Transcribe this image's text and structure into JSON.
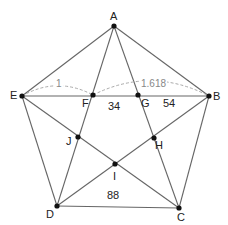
{
  "diagram": {
    "colors": {
      "line": "#666666",
      "point": "#111111",
      "dashed": "#aaaaaa",
      "text": "#222222",
      "arc_text": "#888888"
    },
    "points": {
      "A": {
        "label": "A",
        "x": 114,
        "y": 26
      },
      "B": {
        "label": "B",
        "x": 209,
        "y": 96
      },
      "C": {
        "label": "C",
        "x": 179,
        "y": 208
      },
      "D": {
        "label": "D",
        "x": 57,
        "y": 206
      },
      "E": {
        "label": "E",
        "x": 22,
        "y": 96
      },
      "F": {
        "label": "F",
        "x": 93,
        "y": 95
      },
      "G": {
        "label": "G",
        "x": 138,
        "y": 95
      },
      "H": {
        "label": "H",
        "x": 154,
        "y": 138
      },
      "I": {
        "label": "I",
        "x": 115,
        "y": 164
      },
      "J": {
        "label": "J",
        "x": 78,
        "y": 137
      }
    },
    "region_labels": {
      "fg": "34",
      "gb": "54",
      "dc": "88"
    },
    "measure_labels": {
      "ef": "1",
      "fb": "1.618"
    }
  }
}
